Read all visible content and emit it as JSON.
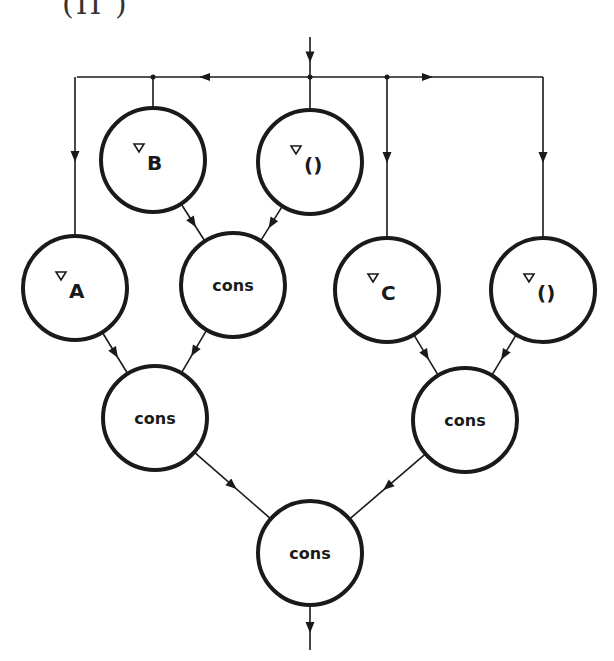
{
  "caption": "(II          )",
  "diagram": {
    "type": "dataflow-graph",
    "input_arrow": {
      "x": 310,
      "y1": 37,
      "y2": 77
    },
    "bus": {
      "y": 77,
      "x1": 77,
      "x2": 543,
      "junctions": [
        153,
        310,
        387
      ]
    },
    "nodes": [
      {
        "id": "b",
        "label_marker": "▿",
        "label": "B",
        "cx": 153,
        "cy": 160
      },
      {
        "id": "nil1",
        "label_marker": "▿",
        "label": "()",
        "cx": 310,
        "cy": 162
      },
      {
        "id": "a",
        "label_marker": "▿",
        "label": "A",
        "cx": 75,
        "cy": 288
      },
      {
        "id": "cons1",
        "label_marker": "",
        "label": "cons",
        "cx": 233,
        "cy": 285
      },
      {
        "id": "c",
        "label_marker": "▿",
        "label": "C",
        "cx": 387,
        "cy": 290
      },
      {
        "id": "nil2",
        "label_marker": "▿",
        "label": "()",
        "cx": 543,
        "cy": 290
      },
      {
        "id": "cons2",
        "label_marker": "",
        "label": "cons",
        "cx": 155,
        "cy": 418
      },
      {
        "id": "cons3",
        "label_marker": "",
        "label": "cons",
        "cx": 465,
        "cy": 420
      },
      {
        "id": "cons4",
        "label_marker": "",
        "label": "cons",
        "cx": 310,
        "cy": 553
      }
    ],
    "edges": [
      {
        "from": "b",
        "to": "cons1"
      },
      {
        "from": "nil1",
        "to": "cons1"
      },
      {
        "from": "a",
        "to": "cons2"
      },
      {
        "from": "cons1",
        "to": "cons2"
      },
      {
        "from": "c",
        "to": "cons3"
      },
      {
        "from": "nil2",
        "to": "cons3"
      },
      {
        "from": "cons2",
        "to": "cons4"
      },
      {
        "from": "cons3",
        "to": "cons4"
      }
    ],
    "output_arrow": {
      "x": 310,
      "y1": 605,
      "y2": 650
    },
    "stroke_color": "#1a1a1a"
  }
}
